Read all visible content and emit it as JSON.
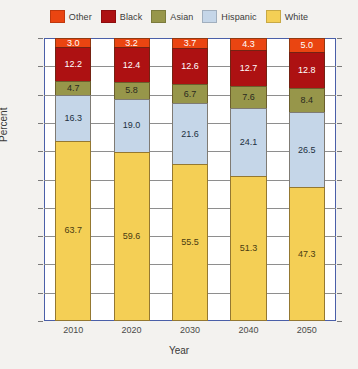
{
  "chart_data": {
    "type": "bar",
    "subtype": "stacked-bar-100",
    "title": "",
    "xlabel": "Year",
    "ylabel": "Percent",
    "ylim": [
      0,
      100
    ],
    "ytick_step": 10,
    "yticks": [
      0,
      10,
      20,
      30,
      40,
      50,
      60,
      70,
      80,
      90,
      100
    ],
    "grid": true,
    "legend_position": "top-center",
    "categories": [
      "2010",
      "2020",
      "2030",
      "2040",
      "2050"
    ],
    "stack_order_bottom_to_top": [
      "White",
      "Hispanic",
      "Asian",
      "Black",
      "Other"
    ],
    "legend_order": [
      "Other",
      "Black",
      "Asian",
      "Hispanic",
      "White"
    ],
    "series": [
      {
        "name": "Other",
        "color": "#ea4511",
        "values": [
          3.0,
          3.2,
          3.7,
          4.3,
          5.0
        ]
      },
      {
        "name": "Black",
        "color": "#ad1112",
        "values": [
          12.2,
          12.4,
          12.6,
          12.7,
          12.8
        ]
      },
      {
        "name": "Asian",
        "color": "#97964a",
        "values": [
          4.7,
          5.8,
          6.7,
          7.6,
          8.4
        ]
      },
      {
        "name": "Hispanic",
        "color": "#c5d6e8",
        "values": [
          16.3,
          19.0,
          21.6,
          24.1,
          26.5
        ]
      },
      {
        "name": "White",
        "color": "#f4cf55",
        "values": [
          63.7,
          59.6,
          55.5,
          51.3,
          47.3
        ]
      }
    ],
    "data_label_colors": {
      "Other": "#ffffff",
      "Black": "#ffffff",
      "Asian": "#2a2a20",
      "Hispanic": "#22303e",
      "White": "#4a3c12"
    }
  },
  "axis": {
    "frame_color": "#4a5fa8",
    "gridline_color": "#8e8e8e"
  },
  "background_color": "#f3f2ef"
}
